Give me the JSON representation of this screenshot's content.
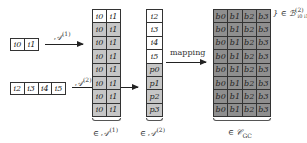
{
  "inputs": {
    "a1_tokens": [
      "i0",
      "i1"
    ],
    "a2_tokens": [
      "i2",
      "i3",
      "i4",
      "i5"
    ]
  },
  "arrows": {
    "a1_label": "𝒜",
    "a1_sup": "(1)",
    "a2_label": "𝒜",
    "a2_sup": "(2)",
    "mapping_label": "mapping"
  },
  "column_a1": {
    "rows": [
      {
        "cells": [
          "i0",
          "i1"
        ],
        "shade": "white"
      },
      {
        "cells": [
          "i0",
          "i1"
        ],
        "shade": "gray"
      },
      {
        "cells": [
          "i0",
          "i1"
        ],
        "shade": "gray"
      },
      {
        "cells": [
          "i0",
          "i1"
        ],
        "shade": "gray"
      },
      {
        "cells": [
          "i0",
          "i1"
        ],
        "shade": "gray"
      },
      {
        "cells": [
          "i0",
          "i1"
        ],
        "shade": "gray"
      },
      {
        "cells": [
          "i0",
          "i1"
        ],
        "shade": "gray"
      },
      {
        "cells": [
          "i0",
          "i1"
        ],
        "shade": "gray"
      }
    ],
    "caption_prefix": "∈ 𝒜",
    "caption_sup": "(1)"
  },
  "column_a2": {
    "rows": [
      {
        "cell": "i2",
        "shade": "white"
      },
      {
        "cell": "i3",
        "shade": "white"
      },
      {
        "cell": "i4",
        "shade": "white"
      },
      {
        "cell": "i5",
        "shade": "white"
      },
      {
        "cell": "p0",
        "shade": "gray"
      },
      {
        "cell": "p1",
        "shade": "gray"
      },
      {
        "cell": "p2",
        "shade": "gray"
      },
      {
        "cell": "p3",
        "shade": "gray"
      }
    ],
    "caption_prefix": "∈ 𝒜",
    "caption_sup": "(2)"
  },
  "grid_c": {
    "rows": [
      [
        "b0",
        "b1",
        "b2",
        "b3"
      ],
      [
        "b0",
        "b1",
        "b2",
        "b3"
      ],
      [
        "b0",
        "b1",
        "b2",
        "b3"
      ],
      [
        "b0",
        "b1",
        "b2",
        "b3"
      ],
      [
        "b0",
        "b1",
        "b2",
        "b3"
      ],
      [
        "b0",
        "b1",
        "b2",
        "b3"
      ],
      [
        "b0",
        "b1",
        "b2",
        "b3"
      ],
      [
        "b0",
        "b1",
        "b2",
        "b3"
      ]
    ],
    "caption_prefix": "∈ 𝒞",
    "caption_sub": "GC",
    "row_annotation_prefix": "} ∈ ℬ",
    "row_annotation_sup": "(2)",
    "row_annotation_sub": "i0 i1"
  },
  "colors": {
    "white_cell": "#ffffff",
    "light_gray_cell": "#c6c6c6",
    "dark_gray_cell": "#8f8f8f",
    "line": "#333333"
  }
}
